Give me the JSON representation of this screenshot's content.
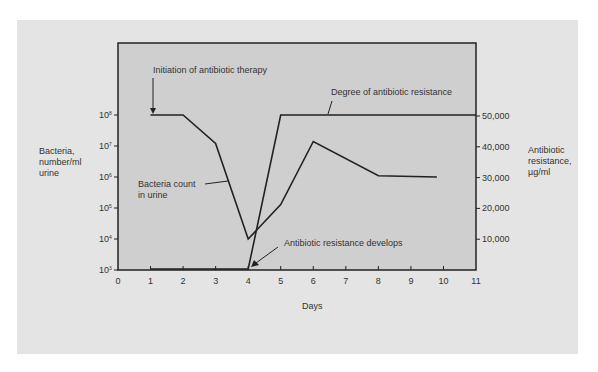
{
  "chart_data": {
    "type": "line",
    "title": "",
    "xlabel": "Days",
    "ylabel": "Bacteria, number/ml urine",
    "y2label": "Antibiotic resistance, µg/ml",
    "x_ticks": [
      "0",
      "1",
      "2",
      "3",
      "4",
      "5",
      "6",
      "7",
      "8",
      "9",
      "10",
      "11"
    ],
    "xlim": [
      0,
      11
    ],
    "y_ticks": [
      {
        "base": "10",
        "exp": "8"
      },
      {
        "base": "10",
        "exp": "7"
      },
      {
        "base": "10",
        "exp": "6"
      },
      {
        "base": "10",
        "exp": "5"
      },
      {
        "base": "10",
        "exp": "4"
      },
      {
        "base": "10",
        "exp": "3"
      }
    ],
    "ylim": [
      1000,
      100000000
    ],
    "yscale": "log",
    "y2_ticks": [
      "50,000",
      "40,000",
      "30,000",
      "20,000",
      "10,000"
    ],
    "y2lim": [
      0,
      50000
    ],
    "grid": false,
    "series": [
      {
        "name": "Bacteria count in urine",
        "axis": "left",
        "x": [
          1,
          2,
          3,
          4,
          5,
          6,
          8,
          9.8
        ],
        "values": [
          100000000,
          100000000,
          12000000,
          10000,
          130000,
          14000000,
          1100000,
          1000000
        ]
      },
      {
        "name": "Degree of antibiotic resistance",
        "axis": "right",
        "x": [
          1,
          4,
          5,
          11
        ],
        "values": [
          0,
          0,
          50000,
          50000
        ]
      }
    ],
    "annotations": [
      {
        "text": "Initiation of antibiotic therapy",
        "x": 1,
        "arrow": true
      },
      {
        "text": "Degree of antibiotic resistance",
        "target": "resistance line"
      },
      {
        "text": "Bacteria count",
        "text2": "in urine",
        "target": "bacteria line"
      },
      {
        "text": "Antibiotic resistance develops",
        "x": 4,
        "arrow": true
      }
    ]
  },
  "labels": {
    "left_axis": [
      "Bacteria,",
      "number/ml",
      "urine"
    ],
    "right_axis": [
      "Antibiotic",
      "resistance,",
      "µg/ml"
    ],
    "x_axis": "Days",
    "initiation": "Initiation of antibiotic therapy",
    "degree": "Degree of antibiotic resistance",
    "bacteria_1": "Bacteria count",
    "bacteria_2": "in urine",
    "develops": "Antibiotic resistance develops"
  },
  "colors": {
    "panel": "#e4e4e4",
    "plot": "#cfcfcf",
    "line": "#222222"
  }
}
